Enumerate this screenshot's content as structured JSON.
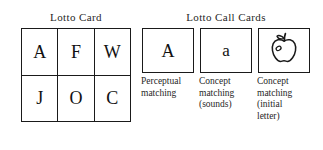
{
  "figure": {
    "background_color": "#ffffff",
    "ink_color": "#1a1a1a"
  },
  "lotto_card": {
    "title": "Lotto Card",
    "rows": [
      [
        "A",
        "F",
        "W"
      ],
      [
        "J",
        "O",
        "C"
      ]
    ]
  },
  "call_cards": {
    "title": "Lotto Call Cards",
    "items": [
      {
        "glyph": "A",
        "icon": "",
        "caption_lines": [
          "Perceptual",
          "matching"
        ]
      },
      {
        "glyph": "a",
        "icon": "",
        "caption_lines": [
          "Concept",
          "matching",
          "(sounds)"
        ]
      },
      {
        "glyph": "",
        "icon": "apple-icon",
        "caption_lines": [
          "Concept",
          "matching",
          "(initial",
          "letter)"
        ]
      }
    ]
  }
}
